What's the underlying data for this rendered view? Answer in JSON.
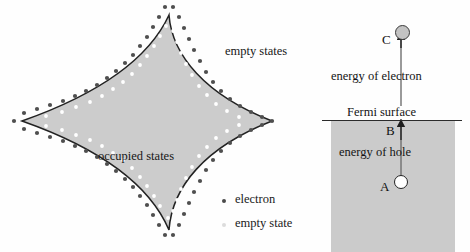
{
  "figure": {
    "type": "physics-diagram"
  },
  "left_panel": {
    "name": "fermi-surface-contour",
    "shape": "four-pointed star (concave square) Fermi surface",
    "fill_color": "#cccccc",
    "outline_color": "#1f1f1f",
    "labels": {
      "empty_states": "empty states",
      "occupied_states": "occupied states"
    },
    "legend": [
      {
        "marker": "electron-dot",
        "color": "#4a4a4a",
        "label": "electron"
      },
      {
        "marker": "empty-state-dot",
        "color": "#dcdcdc",
        "label": "empty state"
      }
    ],
    "dot_markers": {
      "electron_color": "#4a4a4a",
      "empty_state_color": "#ffffff"
    }
  },
  "right_panel": {
    "name": "energy-level-diagram",
    "band_fill_color": "#cbcbcb",
    "fermi_line_color": "#2b2b2b",
    "labels": {
      "energy_of_electron": "energy of electron",
      "fermi_surface": "Fermi surface",
      "energy_of_hole": "energy of hole"
    },
    "points": [
      {
        "id": "A",
        "label": "A",
        "state": "hole",
        "fill": "#ffffff",
        "position": "below Fermi surface"
      },
      {
        "id": "B",
        "label": "B",
        "state": "fermi-level",
        "position": "at Fermi surface"
      },
      {
        "id": "C",
        "label": "C",
        "state": "electron",
        "fill": "#c3c3c3",
        "position": "above Fermi surface"
      }
    ],
    "arrow": {
      "name": "excitation-arrow",
      "from": "A",
      "to": "C",
      "direction": "upward"
    }
  }
}
